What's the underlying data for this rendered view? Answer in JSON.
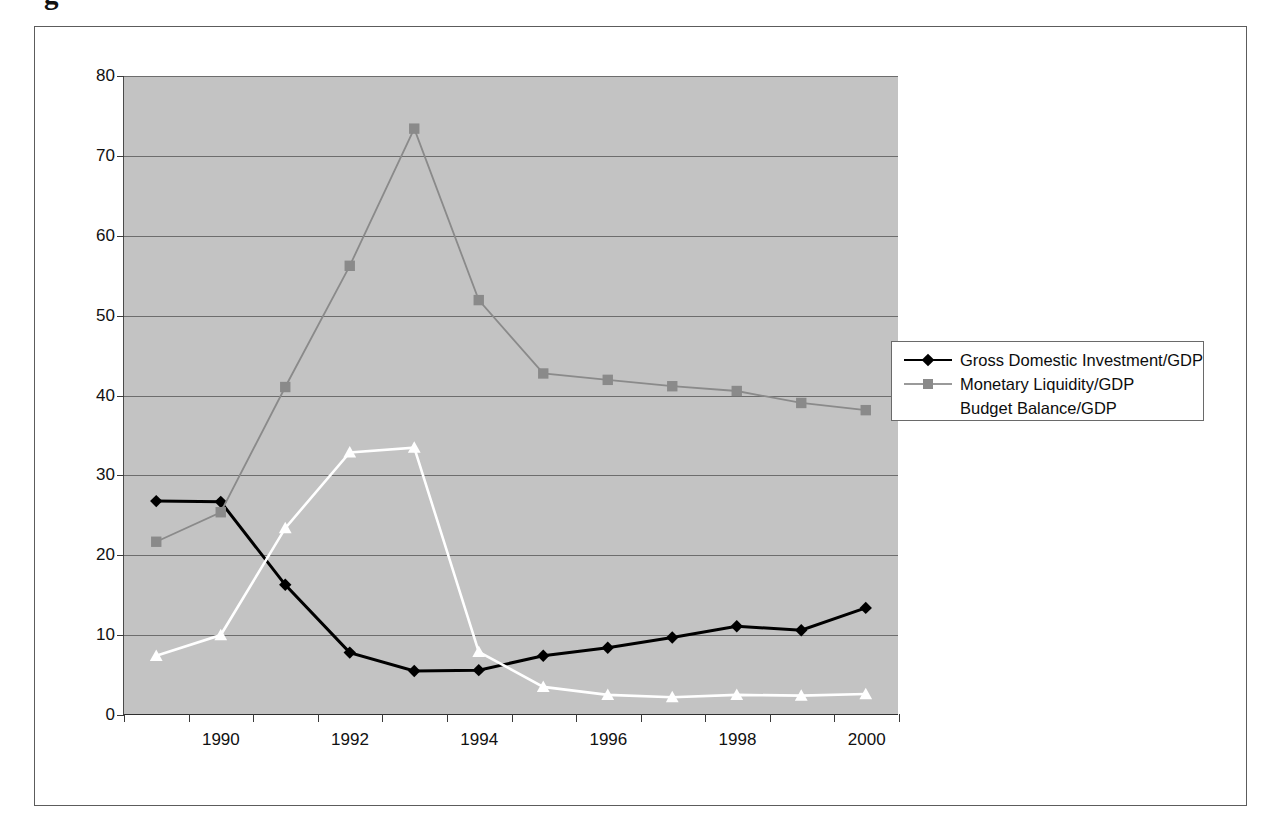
{
  "caption_fragment": "g",
  "chart_data": {
    "type": "line",
    "title": "",
    "xlabel": "",
    "ylabel": "",
    "x": [
      1989,
      1990,
      1991,
      1992,
      1993,
      1994,
      1995,
      1996,
      1997,
      1998,
      1999,
      2000
    ],
    "x_tick_labels": [
      "",
      "1990",
      "",
      "1992",
      "",
      "1994",
      "",
      "1996",
      "",
      "1998",
      "",
      "2000"
    ],
    "y_ticks": [
      0,
      10,
      20,
      30,
      40,
      50,
      60,
      70,
      80
    ],
    "ylim": [
      0,
      80
    ],
    "grid": "horizontal",
    "legend_position": "right",
    "plot_bgcolor": "#c3c3c3",
    "series": [
      {
        "name": "Gross Domestic Investment/GDP",
        "color": "#000000",
        "marker": "diamond",
        "values": [
          26.7,
          26.6,
          16.2,
          7.7,
          5.4,
          5.5,
          7.3,
          8.3,
          9.6,
          11.0,
          10.5,
          13.3
        ]
      },
      {
        "name": "Monetary Liquidity/GDP",
        "color": "#8a8a8a",
        "marker": "square",
        "values": [
          21.6,
          25.3,
          41.0,
          56.2,
          73.4,
          51.9,
          42.7,
          41.9,
          41.1,
          40.5,
          39.0,
          38.1
        ]
      },
      {
        "name": "Budget Balance/GDP",
        "color": "#ffffff",
        "marker": "triangle",
        "values": [
          7.3,
          9.9,
          23.3,
          32.8,
          33.4,
          7.8,
          3.4,
          2.4,
          2.1,
          2.4,
          2.3,
          2.5
        ]
      }
    ]
  },
  "legend": {
    "items": [
      {
        "label": "Gross Domestic Investment/GDP"
      },
      {
        "label": "Monetary Liquidity/GDP"
      },
      {
        "label": "Budget Balance/GDP"
      }
    ]
  }
}
